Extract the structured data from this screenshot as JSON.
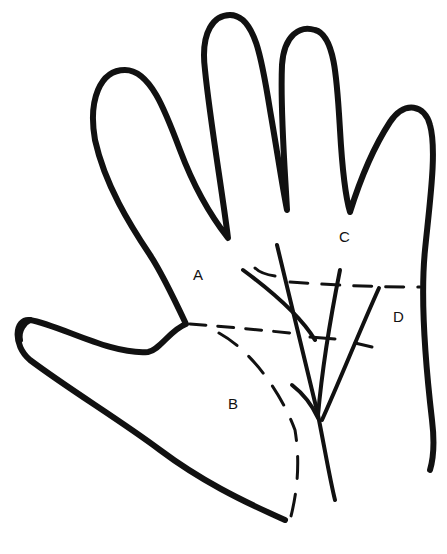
{
  "diagram": {
    "labels": [
      {
        "id": "A",
        "text": "A",
        "x": 193,
        "y": 274
      },
      {
        "id": "B",
        "text": "B",
        "x": 228,
        "y": 403
      },
      {
        "id": "C",
        "text": "C",
        "x": 339,
        "y": 236
      },
      {
        "id": "D",
        "text": "D",
        "x": 393,
        "y": 316
      }
    ],
    "stroke_color": "#111111",
    "background": "#ffffff"
  }
}
